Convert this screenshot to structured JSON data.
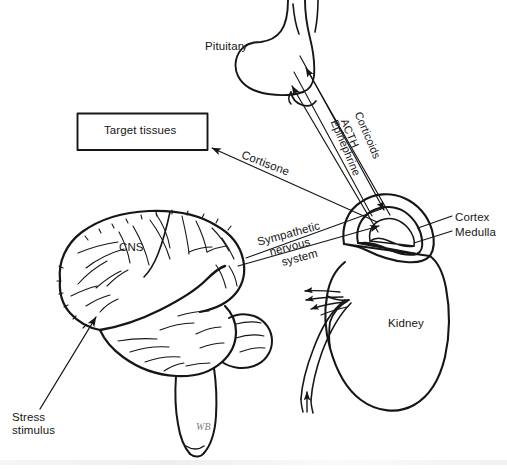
{
  "figure": {
    "background_color": "#ffffff",
    "ink_color": "#161616",
    "signature": "WB"
  },
  "labels": {
    "pituitary": "Pituitary",
    "target_tissues": "Target tissues",
    "cortisone": "Cortisone",
    "corticoids": "Corticoids",
    "acth": "ACTH",
    "epinephrine": "Epinephrine",
    "cortex": "Cortex",
    "medulla": "Medulla",
    "sympathetic_line1": "Sympathetic",
    "sympathetic_line2": "nervous",
    "sympathetic_line3": "system",
    "cns": "CNS",
    "kidney": "Kidney",
    "stress_line1": "Stress",
    "stress_line2": "stimulus"
  },
  "structures": [
    {
      "name": "pituitary-gland",
      "label": "Pituitary"
    },
    {
      "name": "target-tissues-box",
      "label": "Target tissues"
    },
    {
      "name": "adrenal-gland",
      "label": "Cortex / Medulla"
    },
    {
      "name": "kidney",
      "label": "Kidney"
    },
    {
      "name": "brain",
      "label": "CNS"
    }
  ],
  "pathways": [
    {
      "name": "corticoids",
      "label": "Corticoids",
      "from": "adrenal-cortex",
      "to": "pituitary"
    },
    {
      "name": "acth",
      "label": "ACTH",
      "from": "pituitary",
      "to": "adrenal-cortex"
    },
    {
      "name": "epinephrine",
      "label": "Epinephrine",
      "from": "adrenal-medulla",
      "to": "pituitary"
    },
    {
      "name": "cortisone",
      "label": "Cortisone",
      "from": "adrenal-gland",
      "to": "target-tissues"
    },
    {
      "name": "sympathetic-nervous-system",
      "label": "Sympathetic nervous system",
      "from": "cns",
      "to": "adrenal-medulla"
    },
    {
      "name": "stress-stimulus",
      "label": "Stress stimulus",
      "from": "external",
      "to": "cns"
    }
  ]
}
